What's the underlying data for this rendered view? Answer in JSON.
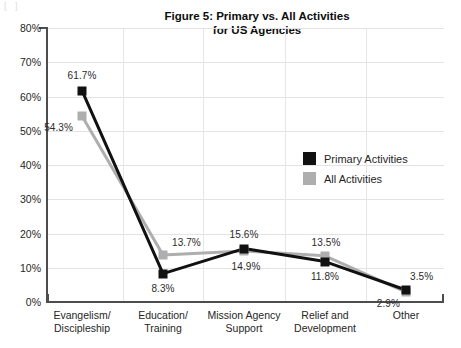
{
  "chart_data": {
    "type": "line",
    "title": "Figure 5: Primary vs. All Activities for US Agencies",
    "title_line1": "Figure 5: Primary vs. All Activities",
    "title_line2": "for US Agencies",
    "xlabel": "",
    "ylabel": "",
    "ylim": [
      0,
      80
    ],
    "yticks": [
      "0%",
      "10%",
      "20%",
      "30%",
      "40%",
      "50%",
      "60%",
      "70%",
      "80%"
    ],
    "ytick_values": [
      0,
      10,
      20,
      30,
      40,
      50,
      60,
      70,
      80
    ],
    "grid": true,
    "legend_position": "center-right",
    "categories": [
      "Evangelism/ Discipleship",
      "Education/ Training",
      "Mission Agency Support",
      "Relief and Development",
      "Other"
    ],
    "category_lines": [
      [
        "Evangelism/",
        "Discipleship"
      ],
      [
        "Education/",
        "Training"
      ],
      [
        "Mission Agency",
        "Support"
      ],
      [
        "Relief and",
        "Development"
      ],
      [
        "Other",
        ""
      ]
    ],
    "series": [
      {
        "name": "Primary Activities",
        "color": "#111111",
        "values": [
          61.7,
          8.3,
          15.6,
          11.8,
          3.5
        ],
        "labels": [
          "61.7%",
          "8.3%",
          "15.6%",
          "11.8%",
          "3.5%"
        ]
      },
      {
        "name": "All Activities",
        "color": "#aeaeae",
        "values": [
          54.3,
          13.7,
          14.9,
          13.5,
          2.9
        ],
        "labels": [
          "54.3%",
          "13.7%",
          "14.9%",
          "13.5%",
          "2.9%"
        ]
      }
    ]
  },
  "artifact": {
    "text": "[   ]"
  }
}
